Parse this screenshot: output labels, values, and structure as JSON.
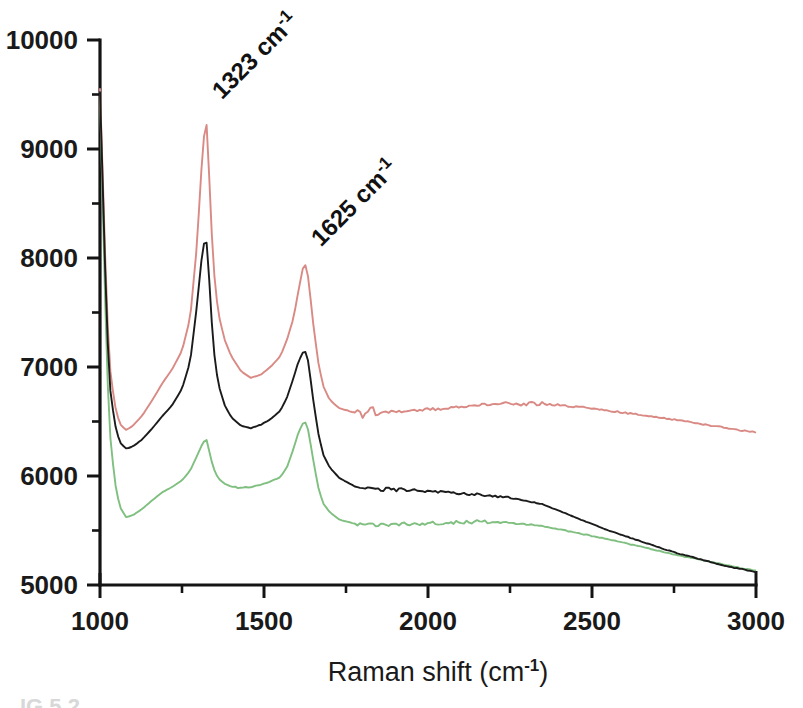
{
  "figure": {
    "background": "#ffffff",
    "caption_fragment": "IG 5.2"
  },
  "chart_data": {
    "type": "line",
    "title": "",
    "subtitle": "",
    "xlabel": "Raman shift (cm",
    "xlabel_sup": "-1",
    "xlabel_tail": ")",
    "ylabel": "",
    "xlim": [
      1000,
      3000
    ],
    "ylim": [
      5000,
      10000
    ],
    "grid": false,
    "legend": "none",
    "x_ticks": [
      1000,
      1500,
      2000,
      2500,
      3000
    ],
    "x_tick_labels": [
      "1000",
      "1500",
      "2000",
      "2500",
      "3000"
    ],
    "x_minor_ticks": [
      1250,
      1750,
      2250,
      2750
    ],
    "y_ticks": [
      5000,
      6000,
      7000,
      8000,
      9000,
      10000
    ],
    "y_tick_labels": [
      "5000",
      "6000",
      "7000",
      "8000",
      "9000",
      "10000"
    ],
    "y_minor_ticks": [
      5500,
      6500,
      7500,
      8500,
      9500
    ],
    "annotations": [
      {
        "text": "1323 cm",
        "sup": "-1",
        "x": 1323,
        "y": 9300,
        "rotation": -45,
        "name": "peak-label-1323"
      },
      {
        "text": "1625 cm",
        "sup": "-1",
        "x": 1625,
        "y": 7950,
        "rotation": -45,
        "name": "peak-label-1625"
      }
    ],
    "colors": {
      "series_red": "#d98a84",
      "series_black": "#1b1b1b",
      "series_green": "#7fbf7f"
    },
    "noise_amplitude": {
      "series_red": 55,
      "series_black": 50,
      "series_green": 45
    },
    "series": [
      {
        "name": "Upper spectrum (red)",
        "color": "#d98a84",
        "x": [
          1000,
          1010,
          1020,
          1030,
          1045,
          1060,
          1080,
          1100,
          1130,
          1160,
          1190,
          1220,
          1250,
          1275,
          1295,
          1310,
          1318,
          1323,
          1328,
          1335,
          1345,
          1360,
          1380,
          1400,
          1430,
          1460,
          1490,
          1520,
          1550,
          1570,
          1590,
          1605,
          1618,
          1625,
          1635,
          1650,
          1665,
          1680,
          1700,
          1730,
          1780,
          1850,
          1950,
          2050,
          2150,
          2250,
          2350,
          2450,
          2550,
          2650,
          2750,
          2850,
          2930,
          3000
        ],
        "y": [
          9550,
          8600,
          7600,
          7000,
          6650,
          6480,
          6420,
          6460,
          6560,
          6700,
          6850,
          6980,
          7150,
          7450,
          8100,
          8850,
          9150,
          9300,
          9100,
          8600,
          7950,
          7500,
          7250,
          7100,
          6960,
          6900,
          6930,
          7000,
          7100,
          7250,
          7450,
          7700,
          7900,
          7950,
          7820,
          7400,
          7050,
          6830,
          6700,
          6620,
          6580,
          6580,
          6600,
          6620,
          6650,
          6670,
          6660,
          6640,
          6600,
          6560,
          6520,
          6470,
          6430,
          6400
        ]
      },
      {
        "name": "Middle spectrum (black)",
        "color": "#1b1b1b",
        "x": [
          1000,
          1010,
          1020,
          1030,
          1045,
          1060,
          1080,
          1100,
          1130,
          1160,
          1190,
          1220,
          1250,
          1275,
          1295,
          1310,
          1318,
          1323,
          1328,
          1335,
          1345,
          1360,
          1380,
          1400,
          1430,
          1460,
          1490,
          1520,
          1550,
          1570,
          1590,
          1605,
          1618,
          1625,
          1635,
          1650,
          1665,
          1680,
          1700,
          1730,
          1780,
          1850,
          1950,
          2050,
          2150,
          2250,
          2350,
          2450,
          2550,
          2650,
          2750,
          2850,
          2930,
          3000
        ],
        "y": [
          9520,
          8500,
          7450,
          6820,
          6480,
          6310,
          6250,
          6270,
          6340,
          6440,
          6550,
          6650,
          6800,
          7050,
          7550,
          8000,
          8150,
          8200,
          8050,
          7700,
          7200,
          6850,
          6650,
          6540,
          6460,
          6440,
          6470,
          6520,
          6600,
          6720,
          6900,
          7050,
          7130,
          7150,
          7050,
          6700,
          6400,
          6200,
          6080,
          5980,
          5900,
          5880,
          5870,
          5850,
          5830,
          5800,
          5740,
          5620,
          5500,
          5400,
          5300,
          5220,
          5160,
          5120
        ]
      },
      {
        "name": "Lower spectrum (green)",
        "color": "#7fbf7f",
        "x": [
          1000,
          1010,
          1020,
          1030,
          1045,
          1060,
          1080,
          1100,
          1130,
          1160,
          1190,
          1220,
          1250,
          1275,
          1295,
          1310,
          1318,
          1323,
          1328,
          1335,
          1345,
          1360,
          1380,
          1400,
          1430,
          1460,
          1490,
          1520,
          1550,
          1570,
          1590,
          1605,
          1618,
          1625,
          1635,
          1650,
          1665,
          1680,
          1700,
          1730,
          1780,
          1850,
          1950,
          2050,
          2150,
          2250,
          2350,
          2450,
          2550,
          2650,
          2750,
          2850,
          2930,
          3000
        ],
        "y": [
          9480,
          8300,
          7100,
          6400,
          5950,
          5720,
          5620,
          5640,
          5700,
          5780,
          5850,
          5900,
          5960,
          6050,
          6180,
          6280,
          6320,
          6350,
          6300,
          6200,
          6080,
          5980,
          5930,
          5900,
          5890,
          5900,
          5920,
          5950,
          5990,
          6080,
          6250,
          6400,
          6480,
          6500,
          6420,
          6150,
          5900,
          5750,
          5670,
          5600,
          5560,
          5550,
          5560,
          5570,
          5580,
          5570,
          5540,
          5480,
          5420,
          5350,
          5280,
          5220,
          5170,
          5130
        ]
      }
    ]
  }
}
